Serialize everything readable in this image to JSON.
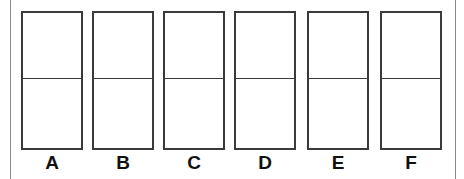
{
  "figure": {
    "title": "",
    "canvas": {
      "width": 464,
      "height": 179,
      "background_color": "#ffffff"
    },
    "frame": {
      "left_rule_color": "#8a8a8a",
      "right_rule_color": "#8a8a8a"
    },
    "box_style": {
      "border_color": "#3a3a3a",
      "fill_color": "#ffffff",
      "divider_color": "#3a3a3a",
      "label_color": "#111111"
    },
    "items": [
      {
        "label": "A",
        "left": 21,
        "cells": 2,
        "top_cell_text": "",
        "bottom_cell_text": ""
      },
      {
        "label": "B",
        "left": 92,
        "cells": 2,
        "top_cell_text": "",
        "bottom_cell_text": ""
      },
      {
        "label": "C",
        "left": 163,
        "cells": 2,
        "top_cell_text": "",
        "bottom_cell_text": ""
      },
      {
        "label": "D",
        "left": 234,
        "cells": 2,
        "top_cell_text": "",
        "bottom_cell_text": ""
      },
      {
        "label": "E",
        "left": 307,
        "cells": 2,
        "top_cell_text": "",
        "bottom_cell_text": ""
      },
      {
        "label": "F",
        "left": 380,
        "cells": 2,
        "top_cell_text": "",
        "bottom_cell_text": ""
      }
    ]
  }
}
